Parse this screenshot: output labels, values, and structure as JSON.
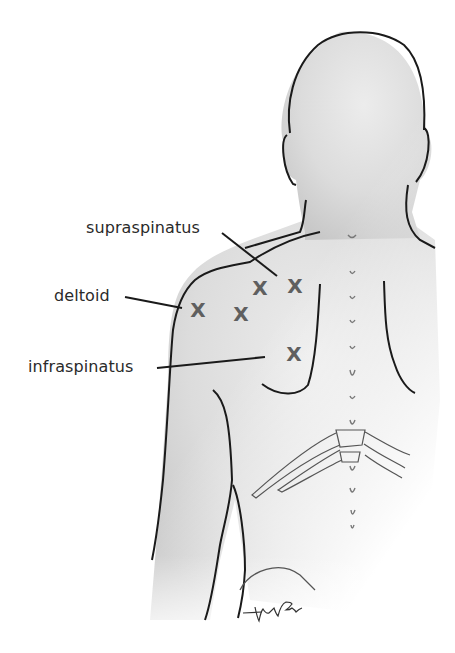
{
  "figure": {
    "colors": {
      "skin": "#e4e4e4",
      "outline": "#1a1a1a",
      "label": "#2a2a2a",
      "marker": "#5f5f5f",
      "background": "#ffffff"
    },
    "labels": [
      {
        "text": "supraspinatus",
        "x": 86,
        "y": 218
      },
      {
        "text": "deltoid",
        "x": 54,
        "y": 286
      },
      {
        "text": "infraspinatus",
        "x": 28,
        "y": 357
      }
    ],
    "markers": [
      {
        "symbol": "X",
        "x": 198,
        "y": 310,
        "muscle": "deltoid"
      },
      {
        "symbol": "X",
        "x": 241,
        "y": 314,
        "muscle": "deltoid"
      },
      {
        "symbol": "X",
        "x": 260,
        "y": 288,
        "muscle": "supraspinatus"
      },
      {
        "symbol": "X",
        "x": 295,
        "y": 286,
        "muscle": "supraspinatus"
      },
      {
        "symbol": "X",
        "x": 294,
        "y": 354,
        "muscle": "infraspinatus"
      }
    ],
    "signature": "Vicky Earle"
  }
}
